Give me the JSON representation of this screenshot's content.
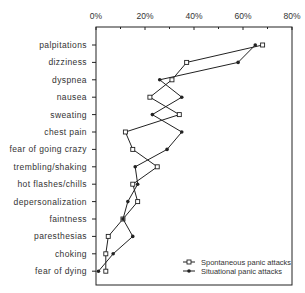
{
  "chart_data": {
    "type": "line",
    "orientation": "horizontal",
    "title": "",
    "xlabel": "",
    "ylabel": "",
    "xlim": [
      0,
      80
    ],
    "x_ticks": [
      "0%",
      "20%",
      "40%",
      "60%",
      "80%"
    ],
    "x_tick_values": [
      0,
      20,
      40,
      60,
      80
    ],
    "grid": false,
    "legend_position": "lower right",
    "categories": [
      "palpitations",
      "dizziness",
      "dyspnea",
      "nausea",
      "sweating",
      "chest pain",
      "fear of going crazy",
      "trembling/shaking",
      "hot  flashes/chills",
      "depersonalization",
      "faintness",
      "paresthesias",
      "choking",
      "fear of dying"
    ],
    "series": [
      {
        "name": "Spontaneous panic attacks",
        "marker": "open-square",
        "values": [
          68,
          37,
          31,
          22,
          34,
          12,
          15,
          25,
          15,
          17,
          11,
          5,
          4,
          4
        ]
      },
      {
        "name": "Situational panic attacks",
        "marker": "filled-circle",
        "values": [
          65,
          58,
          26,
          35,
          23,
          35,
          29,
          16,
          17,
          13,
          11,
          15,
          7,
          1
        ]
      }
    ]
  }
}
